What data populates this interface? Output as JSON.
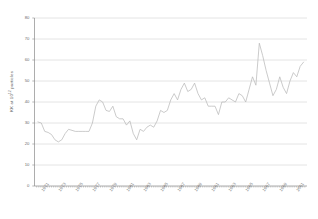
{
  "chart_data": {
    "type": "line",
    "title": "",
    "subtitle": "",
    "xlabel": "",
    "ylabel": "KK at 10^12 particles",
    "ylabel_base": "KK at 10",
    "ylabel_exponent": "12",
    "ylabel_suffix": " particles",
    "ylim": [
      0,
      80
    ],
    "yticks": [
      0,
      10,
      20,
      30,
      40,
      50,
      60,
      70,
      80
    ],
    "ytick_labels": [
      "0",
      "10",
      "20",
      "30",
      "40",
      "50",
      "60",
      "70",
      "80"
    ],
    "xlim": [
      1970,
      2002
    ],
    "xtick_labels": [
      "1971",
      "1973",
      "1975",
      "1977",
      "1979",
      "1981",
      "1983",
      "1985",
      "1987",
      "1989",
      "1991",
      "1993",
      "1995",
      "1997",
      "1999",
      "2001"
    ],
    "xtick_values": [
      1971,
      1973,
      1975,
      1977,
      1979,
      1981,
      1983,
      1985,
      1987,
      1989,
      1991,
      1993,
      1995,
      1997,
      1999,
      2001
    ],
    "minor_xticks_every": 0.25,
    "grid": "horizontal",
    "legend": "none",
    "line_color": "#b9b9b9",
    "grid_color": "#cfcfcf",
    "axis_color": "#8a8a8a",
    "background": "#ffffff",
    "series": [
      {
        "name": "KK at 10^12 particles",
        "x": [
          1970.4,
          1970.8,
          1971.2,
          1971.6,
          1972.0,
          1972.4,
          1972.8,
          1973.2,
          1973.6,
          1974.0,
          1974.4,
          1974.8,
          1975.2,
          1975.6,
          1976.0,
          1976.4,
          1976.8,
          1977.2,
          1977.6,
          1978.0,
          1978.4,
          1978.8,
          1979.2,
          1979.6,
          1980.0,
          1980.4,
          1980.8,
          1981.2,
          1981.6,
          1982.0,
          1982.4,
          1982.8,
          1983.2,
          1983.6,
          1984.0,
          1984.4,
          1984.8,
          1985.2,
          1985.6,
          1986.0,
          1986.4,
          1986.8,
          1987.2,
          1987.6,
          1988.0,
          1988.4,
          1988.8,
          1989.2,
          1989.6,
          1990.0,
          1990.4,
          1990.8,
          1991.2,
          1991.6,
          1992.0,
          1992.4,
          1992.8,
          1993.2,
          1993.6,
          1994.0,
          1994.4,
          1994.8,
          1995.2,
          1995.6,
          1996.0,
          1996.4,
          1996.8,
          1997.2,
          1997.6,
          1998.0,
          1998.4,
          1998.8,
          1999.2,
          1999.6,
          2000.0,
          2000.4,
          2000.8,
          2001.2,
          2001.6
        ],
        "values": [
          30.5,
          30.0,
          26.0,
          25.5,
          24.5,
          22.0,
          21.0,
          22.0,
          25.0,
          27.0,
          26.5,
          26.0,
          26.0,
          26.0,
          26.0,
          26.0,
          30.0,
          38.0,
          41.0,
          40.0,
          36.0,
          35.5,
          38.0,
          33.0,
          32.0,
          32.0,
          29.0,
          31.0,
          25.0,
          22.0,
          27.0,
          26.0,
          28.0,
          29.0,
          28.0,
          31.0,
          36.0,
          35.0,
          36.0,
          41.0,
          44.0,
          41.0,
          46.0,
          49.0,
          45.0,
          46.0,
          49.0,
          44.0,
          41.0,
          42.0,
          38.0,
          38.0,
          38.0,
          34.0,
          40.0,
          40.0,
          42.0,
          41.0,
          40.0,
          44.0,
          43.0,
          40.0,
          46.0,
          52.0,
          48.0,
          68.0,
          62.0,
          55.0,
          49.0,
          43.0,
          46.0,
          52.0,
          47.0,
          44.0,
          50.0,
          54.0,
          52.0,
          57.0,
          59.0
        ]
      }
    ]
  }
}
